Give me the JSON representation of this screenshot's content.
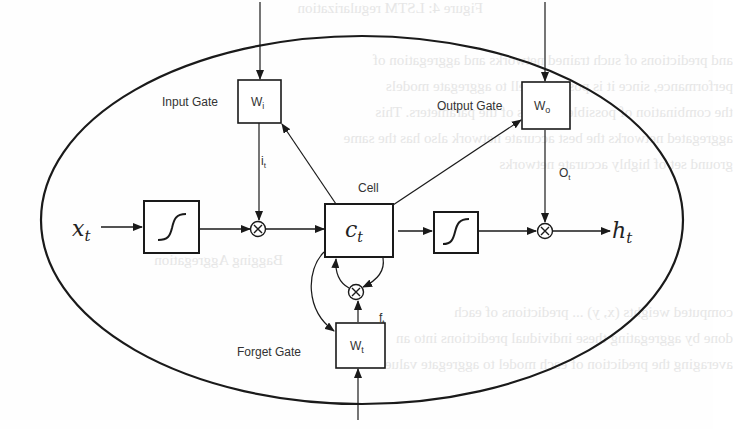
{
  "diagram": {
    "inputs": {
      "x": "x",
      "x_sub": "t"
    },
    "outputs": {
      "h": "h",
      "h_sub": "t"
    },
    "cell": {
      "label": "Cell",
      "symbol": "c",
      "symbol_sub": "t"
    },
    "gates": {
      "input": {
        "label": "Input Gate",
        "weight": "W",
        "weight_sub": "i",
        "signal": "i",
        "signal_sub": "t"
      },
      "output": {
        "label": "Output Gate",
        "weight": "W",
        "weight_sub": "o",
        "signal": "O",
        "signal_sub": "t"
      },
      "forget": {
        "label": "Forget Gate",
        "weight": "W",
        "weight_sub": "t",
        "signal": "f",
        "signal_sub": "t"
      }
    },
    "operators": {
      "multiply": "⊗",
      "activation": "sigmoid"
    },
    "colors": {
      "stroke": "#1a1a1a",
      "label": "#333333",
      "background": "#fefefe"
    }
  },
  "bleed_through_text": [
    "Figure 4: LSTM regularization",
    "and predictions of such trained networks and aggregation of",
    "performance, since it is possible well to aggregate models",
    "the combination of possible settings of the parameters. This",
    "aggregated networks the best accurate network also has the same",
    "ground set of highly accurate networks",
    "Bagging Aggregation",
    "computed weights (x, y) ... predictions of each",
    "done by aggregating these individual predictions into an",
    "averaging the prediction of each model to aggregate values"
  ]
}
